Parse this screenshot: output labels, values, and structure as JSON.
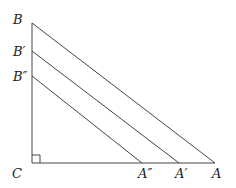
{
  "diagram": {
    "title": "",
    "points": {
      "C": {
        "label": "C",
        "x": 32,
        "y": 163
      },
      "B": {
        "label": "B",
        "x": 32,
        "y": 23
      },
      "B1": {
        "label": "B′",
        "x": 32,
        "y": 51
      },
      "B2": {
        "label": "B″",
        "x": 32,
        "y": 76
      },
      "A": {
        "label": "A",
        "x": 215,
        "y": 163
      },
      "A1": {
        "label": "A′",
        "x": 179,
        "y": 163
      },
      "A2": {
        "label": "A″",
        "x": 142,
        "y": 163
      }
    },
    "segments": [
      {
        "name": "segment-CB",
        "from": "C",
        "to": "B"
      },
      {
        "name": "segment-CA",
        "from": "C",
        "to": "A"
      },
      {
        "name": "segment-BA",
        "from": "B",
        "to": "A"
      },
      {
        "name": "segment-B1A1",
        "from": "B1",
        "to": "A1"
      },
      {
        "name": "segment-B2A2",
        "from": "B2",
        "to": "A2"
      }
    ],
    "right_angle_at": "C",
    "colors": {
      "line": "#444444",
      "text": "#222222"
    }
  }
}
